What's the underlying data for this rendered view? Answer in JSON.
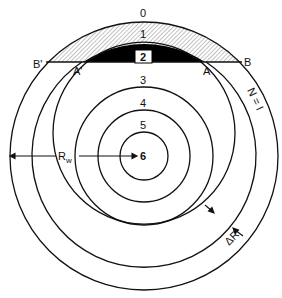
{
  "diagram": {
    "type": "concentric-circles",
    "center": {
      "x": 144,
      "y": 156
    },
    "circles": [
      {
        "label": "0",
        "radius": 134
      },
      {
        "label": "1",
        "radius": 112
      },
      {
        "label": "2",
        "radius": 91
      },
      {
        "label": "3",
        "radius": 69
      },
      {
        "label": "4",
        "radius": 46
      },
      {
        "label": "5",
        "radius": 24
      }
    ],
    "center_label": "6",
    "chord": {
      "y": 62
    },
    "points": {
      "b_prime": "B'",
      "a_prime": "A'",
      "a": "A",
      "b": "B"
    },
    "annotations": {
      "radius_label": "R",
      "radius_subscript": "w",
      "n_label": "N = I",
      "delta_r": "ΔR"
    },
    "fills": {
      "hatched_region": "between circle 0 and chord B'-B",
      "black_region": "cap of circle 1 above chord A'-A"
    },
    "colors": {
      "line": "#111111",
      "fill_black": "#000000",
      "hatch": "#555555",
      "background": "#ffffff"
    }
  }
}
